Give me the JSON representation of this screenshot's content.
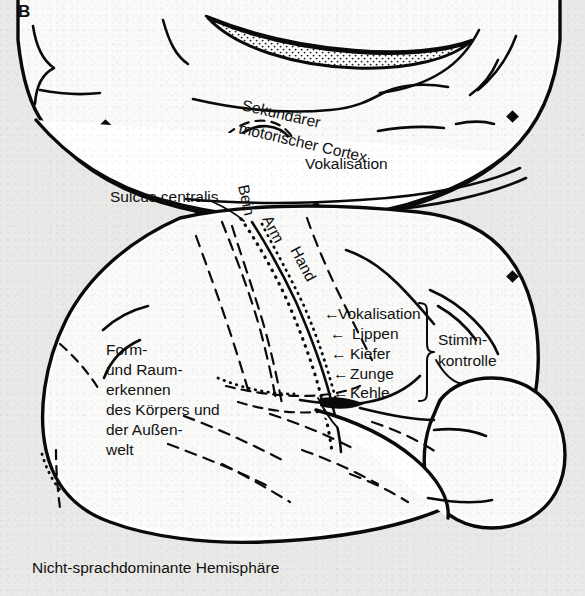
{
  "figure": {
    "panel_label": "B",
    "caption": "Nicht-sprachdominante Hemisphäre",
    "background_color": "#e9e9e7",
    "ink_color": "#0a0a0a",
    "paper_color": "#ffffff"
  },
  "labels": {
    "secondary_motor_cortex": "Sekundärer",
    "secondary_motor_cortex_line2": "motorischer Cortex",
    "vokalisation_top": "Vokalisation",
    "sulcus_centralis": "Sulcus centralis",
    "bein": "Bein",
    "arm": "Arm",
    "hand": "Hand",
    "vokalisation_side": "Vokalisation",
    "lippen": "Lippen",
    "kiefer": "Kiefer",
    "zunge": "Zunge",
    "kehle": "Kehle",
    "stimmkontrolle_1": "Stimm-",
    "stimmkontrolle_2": "kontrolle",
    "form_1": "Form-",
    "form_2": "und Raum-",
    "form_3": "erkennen",
    "form_4": "des Körpers und",
    "form_5": "der Außen-",
    "form_6": "welt",
    "arrow_glyph": "←"
  }
}
